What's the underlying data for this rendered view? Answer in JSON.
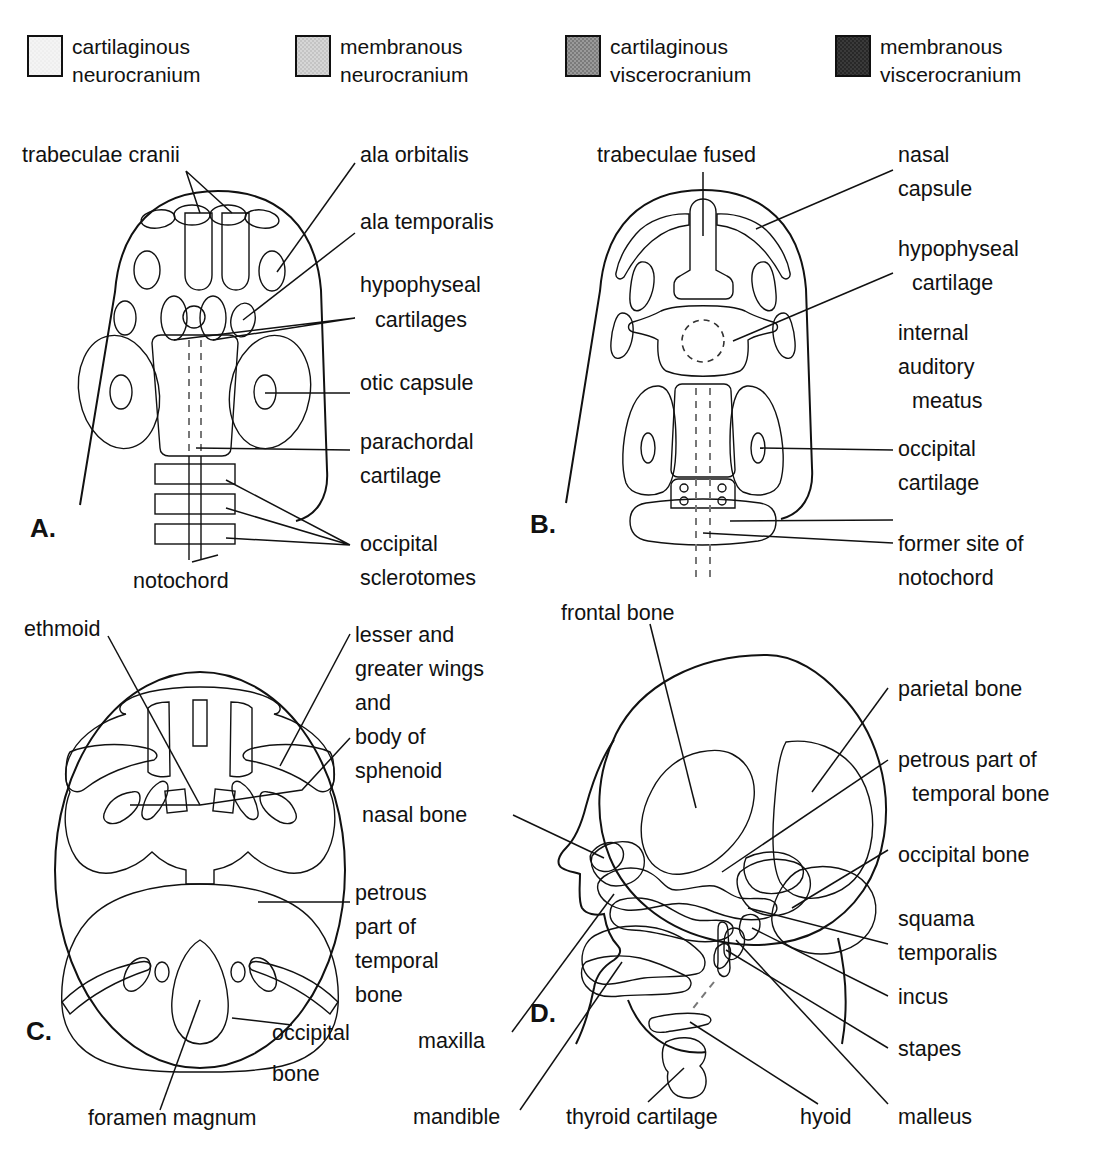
{
  "figure": {
    "colors": {
      "cartilaginous_neurocranium": "#f2f2f2",
      "membranous_neurocranium": "#cfcfcf",
      "cartilaginous_viscerocranium": "#8c8c8c",
      "membranous_viscerocranium": "#333333",
      "outline": "#111111",
      "background": "#ffffff",
      "notochord_dash": "#777777"
    }
  },
  "legend": {
    "items": [
      {
        "label_line1": "cartilaginous",
        "label_line2": "neurocranium",
        "swatch": "#f2f2f2",
        "key": "cartilaginous-neurocranium"
      },
      {
        "label_line1": "membranous",
        "label_line2": "neurocranium",
        "swatch": "#cfcfcf",
        "key": "membranous-neurocranium"
      },
      {
        "label_line1": "cartilaginous",
        "label_line2": "viscerocranium",
        "swatch": "#8c8c8c",
        "key": "cartilaginous-viscerocranium"
      },
      {
        "label_line1": "membranous",
        "label_line2": "viscerocranium",
        "swatch": "#333333",
        "key": "membranous-viscerocranium"
      }
    ]
  },
  "panels": {
    "a": {
      "letter": "A.",
      "labels": {
        "trabeculae_cranii": "trabeculae cranii",
        "ala_orbitalis": "ala orbitalis",
        "ala_temporalis": "ala temporalis",
        "hypophyseal_1": "hypophyseal",
        "hypophyseal_2": "cartilages",
        "otic_capsule": "otic capsule",
        "parachordal_1": "parachordal",
        "parachordal_2": "cartilage",
        "occipital_1": "occipital",
        "occipital_2": "sclerotomes",
        "notochord": "notochord"
      }
    },
    "b": {
      "letter": "B.",
      "labels": {
        "trabeculae_fused": "trabeculae fused",
        "nasal_1": "nasal",
        "nasal_2": "capsule",
        "hypophyseal_1": "hypophyseal",
        "hypophyseal_2": "cartilage",
        "internal_1": "internal",
        "internal_2": "auditory",
        "internal_3": "meatus",
        "occipital_1": "occipital",
        "occipital_2": "cartilage",
        "former_1": "former site of",
        "former_2": "notochord"
      }
    },
    "c": {
      "letter": "C.",
      "labels": {
        "ethmoid": "ethmoid",
        "sphenoid_1": "lesser and",
        "sphenoid_2": "greater wings",
        "sphenoid_3": "and",
        "sphenoid_4": "body of",
        "sphenoid_5": "sphenoid",
        "petrous_1": "petrous",
        "petrous_2": "part of",
        "petrous_3": "temporal",
        "petrous_4": "bone",
        "occipital_1": "occipital",
        "occipital_2": "bone",
        "foramen_magnum": "foramen magnum"
      }
    },
    "d": {
      "letter": "D.",
      "labels": {
        "frontal_bone": "frontal bone",
        "parietal_bone": "parietal bone",
        "petrous_1": "petrous part of",
        "petrous_2": "temporal bone",
        "occipital_bone": "occipital bone",
        "squama_1": "squama",
        "squama_2": "temporalis",
        "incus": "incus",
        "stapes": "stapes",
        "malleus": "malleus",
        "nasal_bone": "nasal bone",
        "maxilla": "maxilla",
        "mandible": "mandible",
        "thyroid_cartilage": "thyroid cartilage",
        "hyoid": "hyoid"
      }
    }
  }
}
